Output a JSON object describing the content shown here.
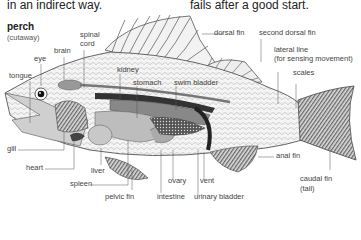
{
  "top_text": {
    "left": "in an indirect way.",
    "right": "fails after a good start."
  },
  "diagram": {
    "title": "perch",
    "subtitle": "(cutaway)",
    "labels": {
      "eye": "eye",
      "brain": "brain",
      "spinal_cord_1": "spinal",
      "spinal_cord_2": "cord",
      "tongue": "tongue",
      "kidney": "kidney",
      "stomach": "stomach",
      "swim_bladder": "swim bladder",
      "dorsal_fin": "dorsal fin",
      "second_dorsal_fin": "second dorsal fin",
      "lateral_line_1": "lateral line",
      "lateral_line_2": "(for sensing movement)",
      "scales": "scales",
      "gill": "gill",
      "heart": "heart",
      "liver": "liver",
      "spleen": "spleen",
      "pelvic_fin": "pelvic fin",
      "intestine": "intestine",
      "ovary": "ovary",
      "vent": "vent",
      "urinary_bladder": "urinary bladder",
      "anal_fin": "anal fin",
      "caudal_fin_1": "caudal fin",
      "caudal_fin_2": "(tail)"
    }
  }
}
